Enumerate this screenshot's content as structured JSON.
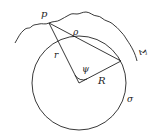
{
  "diagram": {
    "labels": {
      "point": "p",
      "rho": "ρ",
      "r": "r",
      "psi": "ψ",
      "R": "R",
      "sigma": "σ",
      "Sigma": "Σ"
    },
    "colors": {
      "stroke": "#222222",
      "background": "#ffffff"
    }
  }
}
